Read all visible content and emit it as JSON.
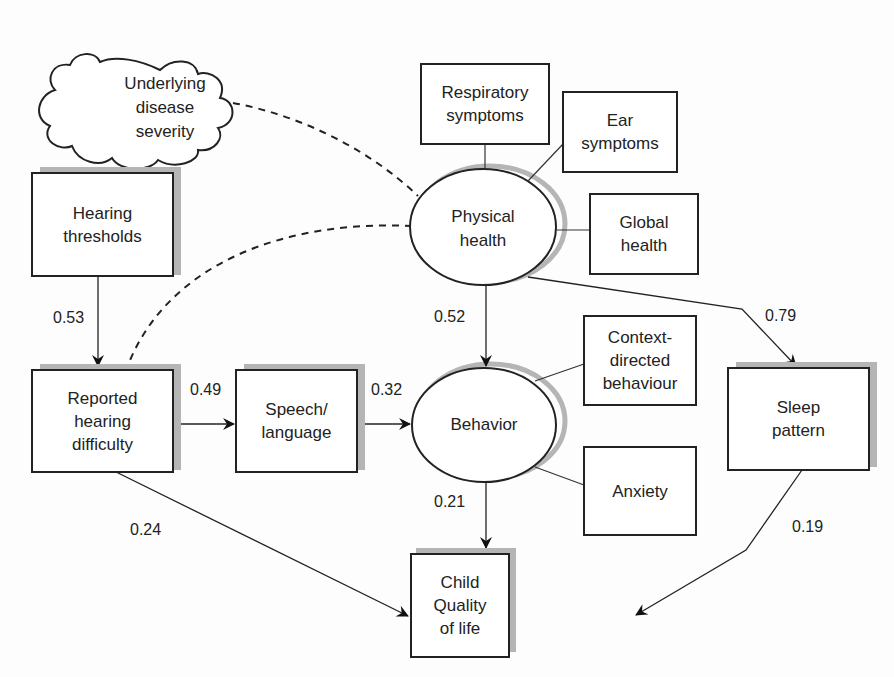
{
  "diagram": {
    "type": "structural-equation-path-model",
    "nodes": {
      "underlying_disease": {
        "label_lines": [
          "Underlying",
          "disease",
          "severity"
        ],
        "shape": "cloud"
      },
      "respiratory": {
        "label": "Respiratory symptoms",
        "label_lines": [
          "Respiratory",
          "symptoms"
        ],
        "shape": "rect"
      },
      "ear": {
        "label_lines": [
          "Ear",
          "symptoms"
        ],
        "shape": "rect"
      },
      "global_health": {
        "label_lines": [
          "Global",
          "health"
        ],
        "shape": "rect"
      },
      "physical_health": {
        "label_lines": [
          "Physical",
          "health"
        ],
        "shape": "ellipse"
      },
      "hearing_thresholds": {
        "label_lines": [
          "Hearing",
          "thresholds"
        ],
        "shape": "rect"
      },
      "reported_hearing": {
        "label_lines": [
          "Reported",
          "hearing",
          "difficulty"
        ],
        "shape": "rect"
      },
      "speech_language": {
        "label_lines": [
          "Speech/",
          "language"
        ],
        "shape": "rect"
      },
      "behavior": {
        "label": "Behavior",
        "shape": "ellipse"
      },
      "context_directed": {
        "label_lines": [
          "Context-",
          "directed",
          "behaviour"
        ],
        "shape": "rect"
      },
      "anxiety": {
        "label": "Anxiety",
        "shape": "rect"
      },
      "sleep_pattern": {
        "label_lines": [
          "Sleep",
          "pattern"
        ],
        "shape": "rect"
      },
      "child_qol": {
        "label_lines": [
          "Child",
          "Quality",
          "of life"
        ],
        "shape": "rect"
      }
    },
    "edges": [
      {
        "from": "hearing_thresholds",
        "to": "reported_hearing",
        "coef": "0.53"
      },
      {
        "from": "reported_hearing",
        "to": "speech_language",
        "coef": "0.49"
      },
      {
        "from": "speech_language",
        "to": "behavior",
        "coef": "0.32"
      },
      {
        "from": "physical_health",
        "to": "behavior",
        "coef": "0.52"
      },
      {
        "from": "physical_health",
        "to": "sleep_pattern",
        "coef": "0.79"
      },
      {
        "from": "behavior",
        "to": "child_qol",
        "coef": "0.21"
      },
      {
        "from": "reported_hearing",
        "to": "child_qol",
        "coef": "0.24"
      },
      {
        "from": "sleep_pattern",
        "to": "child_qol",
        "coef": "0.19"
      },
      {
        "from": "underlying_disease",
        "to": "physical_health",
        "style": "dashed"
      },
      {
        "from": "physical_health",
        "to": "reported_hearing",
        "style": "dashed"
      }
    ]
  }
}
